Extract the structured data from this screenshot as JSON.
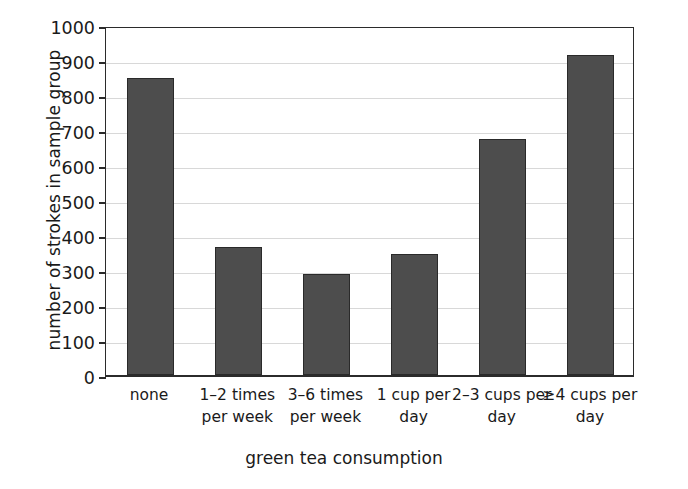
{
  "chart_data": {
    "type": "bar",
    "title": "",
    "xlabel": "green tea consumption",
    "ylabel": "number of strokes in sample group",
    "categories": [
      "none",
      "1–2 times\nper week",
      "3–6 times\nper week",
      "1 cup per\nday",
      "2–3 cups per\nday",
      "≥4 cups per\nday"
    ],
    "values": [
      850,
      365,
      290,
      345,
      675,
      915
    ],
    "ylim": [
      0,
      1000
    ],
    "yticks": [
      0,
      100,
      200,
      300,
      400,
      500,
      600,
      700,
      800,
      900,
      1000
    ],
    "ytick_labels": [
      "0",
      "100",
      "200",
      "300",
      "400",
      "500",
      "600",
      "700",
      "800",
      "900",
      "1000"
    ],
    "grid": true,
    "legend": false,
    "bar_color": "#4d4d4d",
    "bar_edge_color": "#2a2a2a",
    "grid_color": "#d8d8d8",
    "axis_color": "#2b2b2b",
    "background": "#ffffff"
  },
  "axis_titles": {
    "x": "green tea consumption",
    "y": "number of strokes in sample group"
  },
  "x_tick_lines": [
    [
      "none"
    ],
    [
      "1–2 times",
      "per week"
    ],
    [
      "3–6 times",
      "per week"
    ],
    [
      "1 cup per",
      "day"
    ],
    [
      "2–3 cups per",
      "day"
    ],
    [
      "≥4 cups per",
      "day"
    ]
  ]
}
